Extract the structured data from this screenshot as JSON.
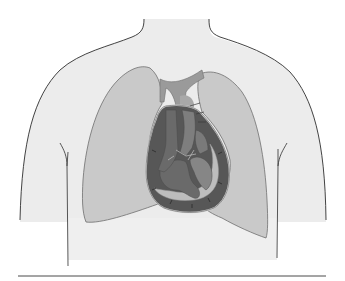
{
  "figure": {
    "style": "grayscale",
    "colors": {
      "background": "#ffffff",
      "torso_fill": "#ececec",
      "outline": "#2e2e2e",
      "lung_fill": "#c9c9c9",
      "lung_stroke": "#6e6e6e",
      "vessel_fill": "#9a9a9a",
      "pericardium_fill": "#575757",
      "pericardial_space": "#bdbdbd",
      "chamber_dark": "#6a6a6a",
      "chamber_mid": "#868686",
      "baseline": "#4a4a4a"
    },
    "parts": [
      {
        "id": "torso",
        "label": ""
      },
      {
        "id": "left-lung",
        "label": ""
      },
      {
        "id": "right-lung",
        "label": ""
      },
      {
        "id": "great-vessels",
        "label": ""
      },
      {
        "id": "pericardium",
        "label": ""
      },
      {
        "id": "heart",
        "label": ""
      },
      {
        "id": "baseline",
        "label": ""
      }
    ]
  }
}
